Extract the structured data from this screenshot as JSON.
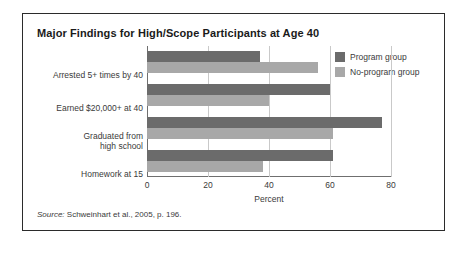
{
  "chart_data": {
    "type": "bar",
    "orientation": "horizontal",
    "title": "Major Findings for High/Scope Participants at Age 40",
    "xlabel": "Percent",
    "ylabel": "",
    "xlim": [
      0,
      80
    ],
    "xticks": [
      0,
      20,
      40,
      60,
      80
    ],
    "grid": true,
    "legend_position": "top-right",
    "categories": [
      "Arrested 5+ times by 40",
      "Earned $20,000+ at 40",
      "Graduated from high school",
      "Homework at 15"
    ],
    "series": [
      {
        "name": "Program group",
        "color": "#6b6b6b",
        "values": [
          37,
          60,
          77,
          61
        ]
      },
      {
        "name": "No-program group",
        "color": "#a8a8a8",
        "values": [
          56,
          40,
          61,
          38
        ]
      }
    ]
  },
  "figure": {
    "title": "Major Findings for High/Scope Participants at Age 40",
    "source_prefix": "Source:",
    "source_text": " Schweinhart et al., 2005, p. 196."
  },
  "category_lines": [
    [
      "Arrested 5+ times by 40"
    ],
    [
      "Earned $20,000+ at 40"
    ],
    [
      "Graduated from",
      "high school"
    ],
    [
      "Homework at 15"
    ]
  ],
  "axis": {
    "xlabel": "Percent",
    "ticks": [
      "0",
      "20",
      "40",
      "60",
      "80"
    ]
  },
  "legend": {
    "items": [
      {
        "label": "Program group",
        "color": "#6b6b6b"
      },
      {
        "label": "No-program group",
        "color": "#a8a8a8"
      }
    ]
  }
}
